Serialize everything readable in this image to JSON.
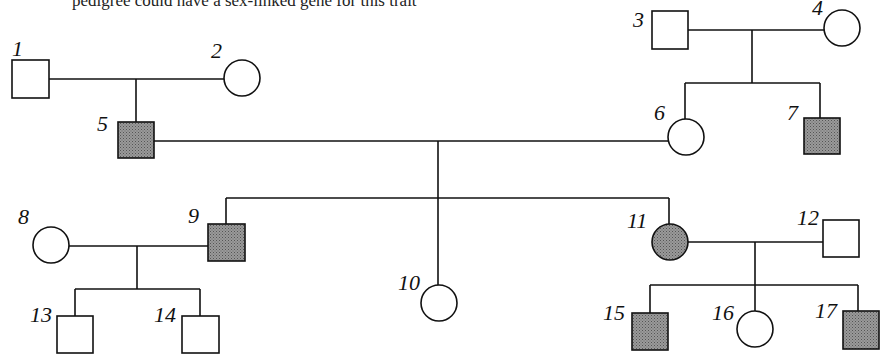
{
  "header": {
    "text": "pedigree could have a sex-linked gene for this trait"
  },
  "colors": {
    "line": "#111111",
    "affected_fill": "#8a8a8a",
    "unaffected_fill": "#ffffff"
  },
  "individuals": [
    {
      "id": "1",
      "label": "1",
      "sex": "male",
      "affected": false
    },
    {
      "id": "2",
      "label": "2",
      "sex": "female",
      "affected": false
    },
    {
      "id": "3",
      "label": "3",
      "sex": "male",
      "affected": false
    },
    {
      "id": "4",
      "label": "4",
      "sex": "female",
      "affected": false
    },
    {
      "id": "5",
      "label": "5",
      "sex": "male",
      "affected": true
    },
    {
      "id": "6",
      "label": "6",
      "sex": "female",
      "affected": false
    },
    {
      "id": "7",
      "label": "7",
      "sex": "male",
      "affected": true
    },
    {
      "id": "8",
      "label": "8",
      "sex": "female",
      "affected": false
    },
    {
      "id": "9",
      "label": "9",
      "sex": "male",
      "affected": true
    },
    {
      "id": "10",
      "label": "10",
      "sex": "female",
      "affected": false
    },
    {
      "id": "11",
      "label": "11",
      "sex": "female",
      "affected": true
    },
    {
      "id": "12",
      "label": "12",
      "sex": "male",
      "affected": false
    },
    {
      "id": "13",
      "label": "13",
      "sex": "male",
      "affected": false
    },
    {
      "id": "14",
      "label": "14",
      "sex": "male",
      "affected": false
    },
    {
      "id": "15",
      "label": "15",
      "sex": "male",
      "affected": true
    },
    {
      "id": "16",
      "label": "16",
      "sex": "female",
      "affected": false
    },
    {
      "id": "17",
      "label": "17",
      "sex": "male",
      "affected": true
    }
  ],
  "matings": [
    {
      "partners": [
        "1",
        "2"
      ],
      "children": [
        "5"
      ]
    },
    {
      "partners": [
        "3",
        "4"
      ],
      "children": [
        "6",
        "7"
      ]
    },
    {
      "partners": [
        "5",
        "6"
      ],
      "children": [
        "9",
        "10",
        "11"
      ]
    },
    {
      "partners": [
        "8",
        "9"
      ],
      "children": [
        "13",
        "14"
      ]
    },
    {
      "partners": [
        "11",
        "12"
      ],
      "children": [
        "15",
        "16",
        "17"
      ]
    }
  ]
}
